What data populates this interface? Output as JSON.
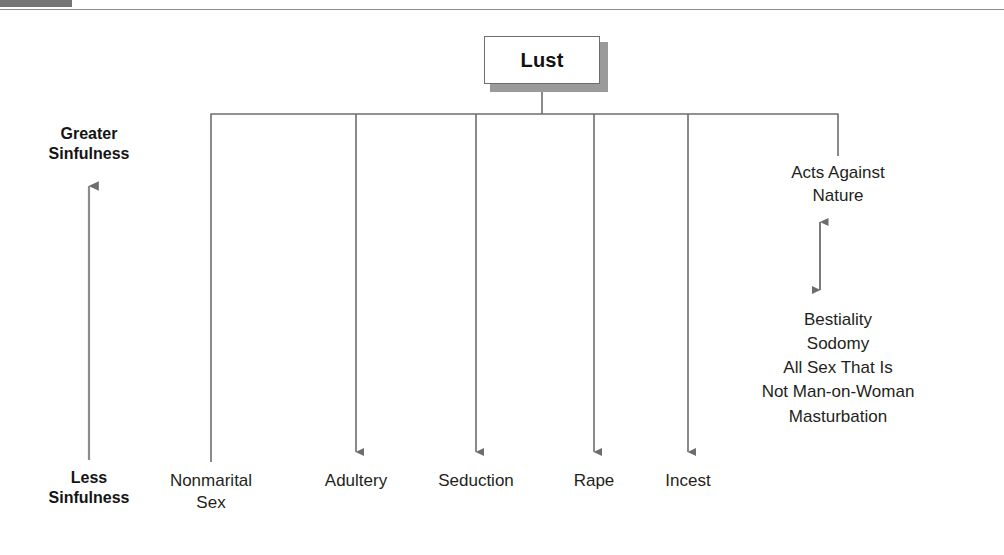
{
  "figure": {
    "header_caption_fragment": "",
    "root": {
      "label": "Lust"
    },
    "axis": {
      "top_label": "Greater\nSinfulness",
      "bottom_label": "Less\nSinfulness",
      "direction_icon": "up-arrow-icon"
    },
    "leaves": [
      {
        "id": "nonmarital-sex",
        "label": "Nonmarital\nSex",
        "x": 211,
        "arrowhead": false
      },
      {
        "id": "adultery",
        "label": "Adultery",
        "x": 356,
        "arrowhead": true
      },
      {
        "id": "seduction",
        "label": "Seduction",
        "x": 476,
        "arrowhead": true
      },
      {
        "id": "rape",
        "label": "Rape",
        "x": 594,
        "arrowhead": true
      },
      {
        "id": "incest",
        "label": "Incest",
        "x": 688,
        "arrowhead": true
      }
    ],
    "right_branch": {
      "head_label": "Acts Against\nNature",
      "connector_icon": "double-headed-vertical-arrow-icon",
      "items": [
        "Bestiality",
        "Sodomy",
        "All Sex That Is",
        "Not Man-on-Woman",
        "Masturbation"
      ]
    },
    "colors": {
      "line": "#6d6d6d",
      "arrow": "#6d6d6d",
      "box_border": "#6d6d6d",
      "box_shadow": "#9a9a9a",
      "header_tab": "#757575",
      "text": "#231f20"
    }
  }
}
